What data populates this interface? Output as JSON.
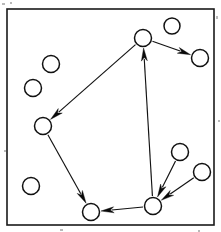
{
  "figure": {
    "kind": "directed-graph-diagram",
    "width": 221,
    "height": 232,
    "background_color": "#ffffff",
    "ink_color": "#111111",
    "frame": {
      "label": "diagram-border",
      "x": 7,
      "y": 9,
      "width": 207,
      "height": 216,
      "stroke_color": "#1a1a1a",
      "stroke_width": 1.6
    },
    "node_style": {
      "radius": 8.5,
      "fill": "#ffffff",
      "stroke": "#111111",
      "stroke_width": 1.5
    },
    "edge_style": {
      "stroke": "#111111",
      "stroke_width": 1.15,
      "arrow_head_fill": "#0a0a0a",
      "arrow_head_length": 13,
      "arrow_head_width": 6
    },
    "nodes": [
      {
        "id": "n1",
        "name": "node-top-center",
        "cx": 143,
        "cy": 38,
        "r": 8.5
      },
      {
        "id": "n2",
        "name": "node-top-right-upper",
        "cx": 172,
        "cy": 26,
        "r": 8.0
      },
      {
        "id": "n3",
        "name": "node-right-upper",
        "cx": 200,
        "cy": 58,
        "r": 8.5
      },
      {
        "id": "n4",
        "name": "node-left-upper",
        "cx": 51,
        "cy": 64,
        "r": 8.5
      },
      {
        "id": "n5",
        "name": "node-left-outer",
        "cx": 33,
        "cy": 88,
        "r": 8.5
      },
      {
        "id": "n6",
        "name": "node-left-middle",
        "cx": 43,
        "cy": 126,
        "r": 8.5
      },
      {
        "id": "n7",
        "name": "node-left-lower",
        "cx": 31,
        "cy": 186,
        "r": 8.5
      },
      {
        "id": "n8",
        "name": "node-bottom-left",
        "cx": 91,
        "cy": 212,
        "r": 8.5
      },
      {
        "id": "n9",
        "name": "node-bottom-hub",
        "cx": 153,
        "cy": 206,
        "r": 8.5
      },
      {
        "id": "n10",
        "name": "node-right-middle",
        "cx": 180,
        "cy": 152,
        "r": 8.5
      },
      {
        "id": "n11",
        "name": "node-right-lower",
        "cx": 202,
        "cy": 172,
        "r": 8.5
      }
    ],
    "edges": [
      {
        "id": "e1",
        "name": "edge-top-center-to-left-middle",
        "from": "n1",
        "to": "n6",
        "directed": true
      },
      {
        "id": "e2",
        "name": "edge-top-center-to-right-upper",
        "from": "n1",
        "to": "n3",
        "directed": true
      },
      {
        "id": "e3",
        "name": "edge-hub-to-top-center",
        "from": "n9",
        "to": "n1",
        "directed": true
      },
      {
        "id": "e4",
        "name": "edge-left-middle-to-bottom-left",
        "from": "n6",
        "to": "n8",
        "directed": true
      },
      {
        "id": "e5",
        "name": "edge-hub-to-bottom-left",
        "from": "n9",
        "to": "n8",
        "directed": true
      },
      {
        "id": "e6",
        "name": "edge-right-middle-to-hub",
        "from": "n10",
        "to": "n9",
        "directed": true
      },
      {
        "id": "e7",
        "name": "edge-right-lower-to-hub",
        "from": "n11",
        "to": "n9",
        "directed": true
      }
    ],
    "isolated_nodes": [
      "n2",
      "n4",
      "n5",
      "n7"
    ],
    "scan_specks": [
      {
        "x": 2,
        "y": 3,
        "w": 3,
        "h": 2
      },
      {
        "x": 10,
        "y": 2,
        "w": 2,
        "h": 2
      },
      {
        "x": 216,
        "y": 16,
        "w": 2,
        "h": 3
      },
      {
        "x": 4,
        "y": 150,
        "w": 2,
        "h": 2
      },
      {
        "x": 218,
        "y": 120,
        "w": 2,
        "h": 2
      },
      {
        "x": 60,
        "y": 229,
        "w": 3,
        "h": 2
      },
      {
        "x": 198,
        "y": 230,
        "w": 2,
        "h": 2
      }
    ]
  }
}
